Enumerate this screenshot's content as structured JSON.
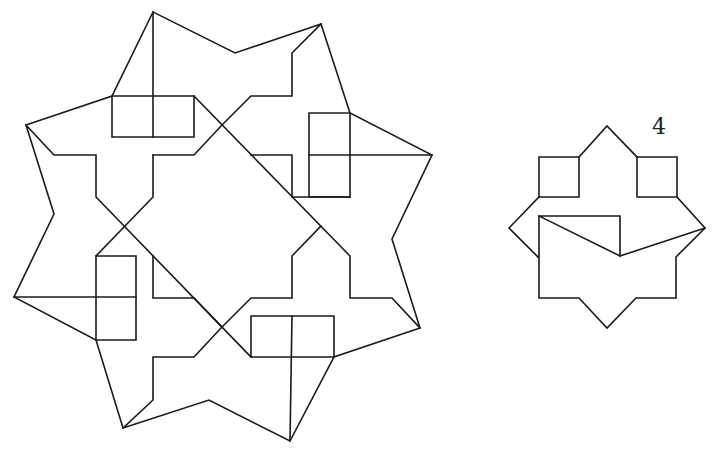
{
  "figures": {
    "large_star": {
      "name": "eight-point-star-with-rectangles",
      "polylines": [
        [
          [
            153,
            12
          ],
          [
            112,
            96
          ],
          [
            26,
            125
          ],
          [
            54,
            214
          ],
          [
            14,
            297
          ],
          [
            96,
            340
          ],
          [
            123,
            428
          ],
          [
            209,
            400
          ],
          [
            290,
            441
          ],
          [
            334,
            357
          ],
          [
            420,
            328
          ],
          [
            392,
            239
          ],
          [
            432,
            155
          ],
          [
            350,
            113
          ],
          [
            321,
            24
          ],
          [
            235,
            53
          ],
          [
            153,
            12
          ]
        ],
        [
          [
            153,
            12
          ],
          [
            153,
            137
          ]
        ],
        [
          [
            112,
            96
          ],
          [
            194,
            96
          ],
          [
            194,
            137
          ],
          [
            112,
            137
          ],
          [
            112,
            96
          ]
        ],
        [
          [
            309,
            113
          ],
          [
            350,
            113
          ],
          [
            350,
            197
          ],
          [
            309,
            197
          ],
          [
            309,
            113
          ]
        ],
        [
          [
            309,
            155
          ],
          [
            432,
            155
          ]
        ],
        [
          [
            96,
            256
          ],
          [
            136,
            256
          ],
          [
            136,
            340
          ],
          [
            96,
            340
          ],
          [
            96,
            256
          ]
        ],
        [
          [
            14,
            297
          ],
          [
            136,
            297
          ]
        ],
        [
          [
            251,
            316
          ],
          [
            334,
            316
          ],
          [
            334,
            357
          ],
          [
            251,
            357
          ],
          [
            251,
            316
          ]
        ],
        [
          [
            292,
            316
          ],
          [
            290,
            441
          ]
        ],
        [
          [
            26,
            125
          ],
          [
            54,
            155
          ],
          [
            96,
            155
          ],
          [
            96,
            197
          ],
          [
            251,
            357
          ]
        ],
        [
          [
            194,
            96
          ],
          [
            350,
            256
          ],
          [
            350,
            298
          ],
          [
            392,
            298
          ],
          [
            420,
            328
          ]
        ],
        [
          [
            153,
            155
          ],
          [
            194,
            155
          ],
          [
            222,
            125
          ],
          [
            251,
            96
          ],
          [
            292,
            96
          ],
          [
            292,
            53
          ],
          [
            321,
            24
          ]
        ],
        [
          [
            153,
            155
          ],
          [
            153,
            197
          ],
          [
            96,
            256
          ]
        ],
        [
          [
            251,
            155
          ],
          [
            292,
            155
          ],
          [
            292,
            197
          ],
          [
            350,
            197
          ]
        ],
        [
          [
            153,
            256
          ],
          [
            153,
            298
          ],
          [
            194,
            298
          ],
          [
            222,
            327
          ]
        ],
        [
          [
            123,
            428
          ],
          [
            153,
            400
          ],
          [
            153,
            357
          ],
          [
            194,
            357
          ],
          [
            222,
            327
          ],
          [
            251,
            298
          ],
          [
            292,
            298
          ],
          [
            292,
            256
          ],
          [
            321,
            226
          ]
        ]
      ]
    },
    "small_star": {
      "name": "small-star-figure",
      "label": "4",
      "polylines": [
        [
          [
            579,
            157
          ],
          [
            607,
            126
          ],
          [
            637,
            157
          ]
        ],
        [
          [
            539,
            157
          ],
          [
            579,
            157
          ],
          [
            579,
            197
          ],
          [
            539,
            197
          ],
          [
            539,
            157
          ]
        ],
        [
          [
            637,
            157
          ],
          [
            677,
            157
          ],
          [
            677,
            197
          ],
          [
            637,
            197
          ],
          [
            637,
            157
          ]
        ],
        [
          [
            539,
            197
          ],
          [
            509,
            228
          ],
          [
            538,
            257
          ]
        ],
        [
          [
            677,
            197
          ],
          [
            705,
            228
          ],
          [
            676,
            257
          ],
          [
            676,
            298
          ],
          [
            636,
            298
          ],
          [
            607,
            328
          ],
          [
            579,
            298
          ],
          [
            539,
            298
          ],
          [
            539,
            216
          ]
        ],
        [
          [
            539,
            216
          ],
          [
            620,
            216
          ],
          [
            620,
            256
          ],
          [
            539,
            216
          ]
        ],
        [
          [
            620,
            256
          ],
          [
            705,
            228
          ]
        ]
      ]
    }
  },
  "colors": {
    "stroke": "#1a1a1a",
    "background": "#ffffff"
  }
}
